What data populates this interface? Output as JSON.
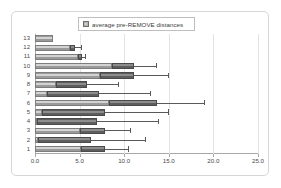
{
  "chart_data": {
    "type": "bar",
    "orientation": "horizontal",
    "stacked": true,
    "title": "",
    "xlabel": "",
    "ylabel": "",
    "xlim": [
      0.0,
      25.0
    ],
    "xticks": [
      "0.0",
      "5.0",
      "10.0",
      "15.0",
      "20.0",
      "25.0"
    ],
    "xtick_values": [
      0.0,
      5.0,
      10.0,
      15.0,
      20.0,
      25.0
    ],
    "grid": true,
    "legend": {
      "position": "top-center",
      "entries": [
        "average pre-REMOVE distances"
      ],
      "marker_color": "#b3b3b3"
    },
    "categories": [
      "13",
      "12",
      "11",
      "10",
      "9",
      "8",
      "7",
      "6",
      "5",
      "4",
      "3",
      "2",
      "1"
    ],
    "series": [
      {
        "name": "average pre-REMOVE distances",
        "color": "#b8b8b8",
        "values": [
          2.0,
          3.9,
          4.8,
          8.6,
          7.3,
          2.4,
          1.4,
          8.3,
          0.8,
          0.2,
          5.0,
          0.3,
          5.2
        ]
      },
      {
        "name": "segment-2",
        "color": "#6e6e6e",
        "values": [
          0.0,
          0.6,
          0.5,
          2.5,
          3.8,
          3.4,
          5.8,
          5.4,
          7.1,
          6.8,
          2.8,
          6.0,
          2.6
        ]
      }
    ],
    "totals": [
      2.0,
      4.5,
      5.3,
      11.1,
      11.1,
      5.8,
      7.2,
      13.7,
      7.9,
      7.0,
      7.8,
      6.3,
      7.8
    ],
    "error_high": [
      2.0,
      5.2,
      5.6,
      13.6,
      14.9,
      9.3,
      12.9,
      19.0,
      14.9,
      13.8,
      10.6,
      12.3,
      10.4
    ]
  }
}
